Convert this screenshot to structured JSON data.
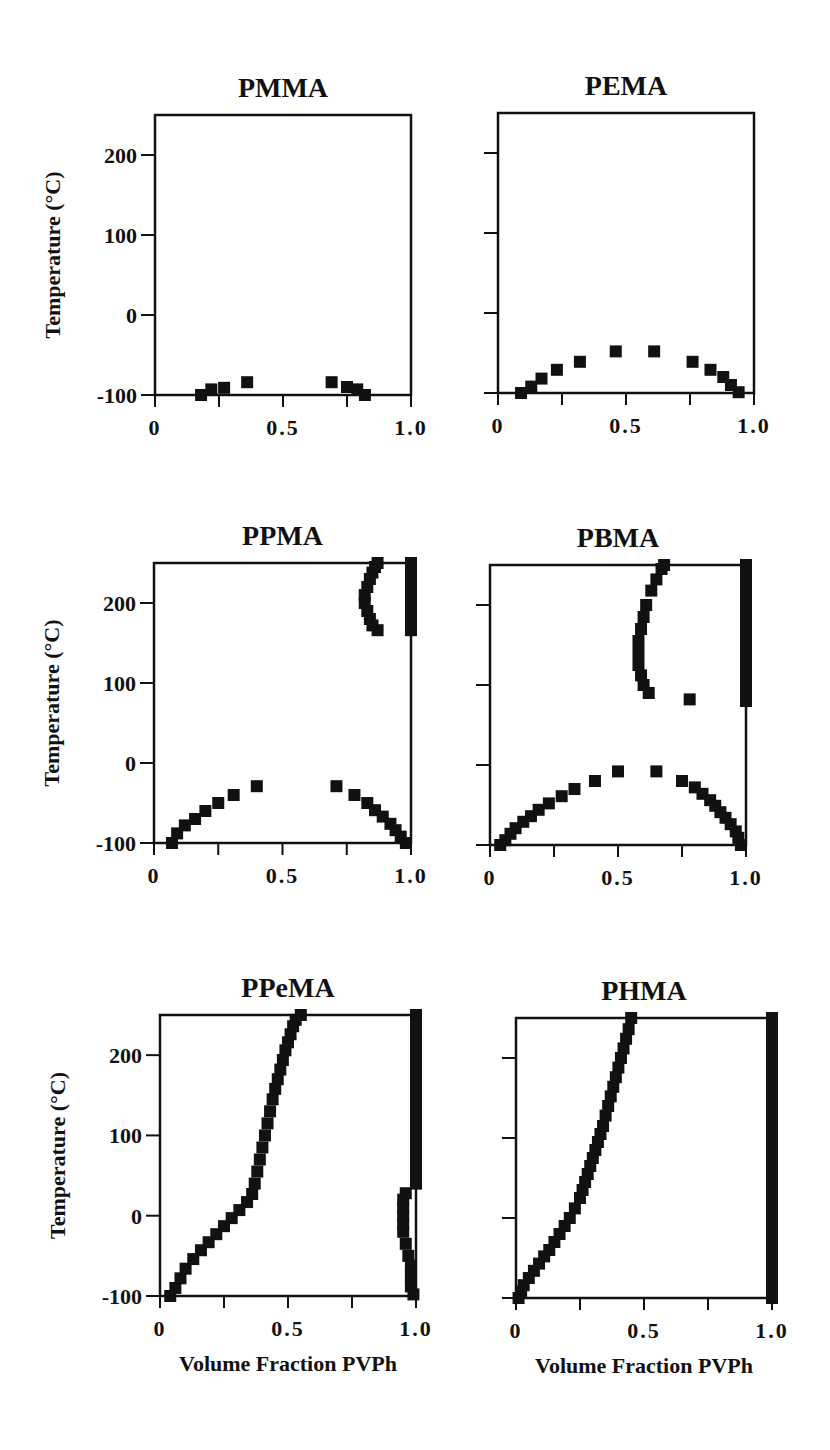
{
  "figure": {
    "background": "#ffffff",
    "ink_color": "#111111",
    "ylabel": "Temperature  (°C)",
    "xlabel": "Volume   Fraction   PVPh"
  },
  "chart_data": [
    {
      "type": "scatter",
      "title": "PMMA",
      "xlabel": "",
      "ylabel": "Temperature  (°C)",
      "xlim": [
        0,
        1.0
      ],
      "ylim": [
        -100,
        250
      ],
      "xticks": [
        "0",
        "0.5",
        "1.0"
      ],
      "yticks": [
        "-100",
        "0",
        "100",
        "200"
      ],
      "show_ytick_labels": true,
      "frame": {
        "x": 155,
        "y": 115,
        "w": 256,
        "h": 280
      },
      "series": [
        {
          "name": "binodal",
          "x": [
            0.18,
            0.22,
            0.27,
            0.36,
            0.69,
            0.75,
            0.79,
            0.82
          ],
          "y": [
            -100,
            -93,
            -91,
            -84,
            -84,
            -90,
            -93,
            -100
          ]
        }
      ]
    },
    {
      "type": "scatter",
      "title": "PEMA",
      "xlabel": "",
      "ylabel": "",
      "xlim": [
        0,
        1.0
      ],
      "ylim": [
        -100,
        250
      ],
      "xticks": [
        "0",
        "0.5",
        "1.0"
      ],
      "yticks": [
        "-100",
        "0",
        "100",
        "200"
      ],
      "show_ytick_labels": false,
      "frame": {
        "x": 498,
        "y": 113,
        "w": 256,
        "h": 280
      },
      "series": [
        {
          "name": "binodal",
          "x": [
            0.09,
            0.13,
            0.17,
            0.23,
            0.32,
            0.46,
            0.61,
            0.76,
            0.83,
            0.88,
            0.91,
            0.94
          ],
          "y": [
            -100,
            -92,
            -82,
            -71,
            -61,
            -48,
            -48,
            -61,
            -71,
            -80,
            -90,
            -99
          ]
        }
      ]
    },
    {
      "type": "scatter",
      "title": "PPMA",
      "xlabel": "",
      "ylabel": "Temperature  (°C)",
      "xlim": [
        0,
        1.0
      ],
      "ylim": [
        -100,
        250
      ],
      "xticks": [
        "0",
        "0.5",
        "1.0"
      ],
      "yticks": [
        "-100",
        "0",
        "100",
        "200"
      ],
      "show_ytick_labels": true,
      "frame": {
        "x": 154,
        "y": 563,
        "w": 257,
        "h": 280
      },
      "series": [
        {
          "name": "lower binodal",
          "x": [
            0.07,
            0.09,
            0.12,
            0.16,
            0.2,
            0.25,
            0.31,
            0.4,
            0.71,
            0.78,
            0.83,
            0.86,
            0.89,
            0.92,
            0.94,
            0.96,
            0.98
          ],
          "y": [
            -100,
            -88,
            -78,
            -70,
            -60,
            -50,
            -40,
            -29,
            -29,
            -40,
            -50,
            -59,
            -67,
            -76,
            -84,
            -92,
            -100
          ]
        },
        {
          "name": "upper binodal left",
          "x": [
            0.87,
            0.86,
            0.85,
            0.84,
            0.83,
            0.82,
            0.82,
            0.83,
            0.84,
            0.85,
            0.87
          ],
          "y": [
            250,
            245,
            238,
            230,
            220,
            210,
            200,
            190,
            180,
            172,
            166
          ]
        },
        {
          "name": "upper binodal right",
          "x": [
            1.0,
            1.0,
            1.0,
            1.0,
            1.0,
            1.0,
            1.0,
            1.0,
            1.0
          ],
          "y": [
            250,
            240,
            230,
            220,
            210,
            200,
            190,
            180,
            166
          ]
        }
      ]
    },
    {
      "type": "scatter",
      "title": "PBMA",
      "xlabel": "",
      "ylabel": "",
      "xlim": [
        0,
        1.0
      ],
      "ylim": [
        -100,
        250
      ],
      "xticks": [
        "0",
        "0.5",
        "1.0"
      ],
      "yticks": [
        "-100",
        "0",
        "100",
        "200"
      ],
      "show_ytick_labels": false,
      "frame": {
        "x": 490,
        "y": 565,
        "w": 256,
        "h": 280
      },
      "series": [
        {
          "name": "lower binodal",
          "x": [
            0.04,
            0.06,
            0.08,
            0.1,
            0.13,
            0.16,
            0.19,
            0.23,
            0.28,
            0.33,
            0.41,
            0.5,
            0.65,
            0.75,
            0.8,
            0.83,
            0.86,
            0.88,
            0.9,
            0.92,
            0.94,
            0.96,
            0.97,
            0.98
          ],
          "y": [
            -100,
            -94,
            -86,
            -79,
            -71,
            -64,
            -56,
            -48,
            -39,
            -30,
            -20,
            -8,
            -8,
            -20,
            -28,
            -36,
            -44,
            -51,
            -59,
            -66,
            -74,
            -83,
            -91,
            -100
          ]
        },
        {
          "name": "upper binodal left",
          "x": [
            0.68,
            0.67,
            0.65,
            0.63,
            0.61,
            0.6,
            0.59,
            0.58,
            0.58,
            0.58,
            0.59,
            0.6,
            0.62
          ],
          "y": [
            250,
            245,
            232,
            218,
            200,
            185,
            170,
            155,
            140,
            125,
            112,
            100,
            90
          ]
        },
        {
          "name": "isolated point",
          "x": [
            0.78
          ],
          "y": [
            82
          ]
        },
        {
          "name": "upper binodal right",
          "x": [
            1.0,
            1.0,
            1.0,
            1.0,
            1.0,
            1.0,
            1.0,
            1.0,
            1.0,
            1.0,
            1.0,
            1.0,
            1.0,
            1.0,
            1.0,
            1.0,
            1.0,
            1.0
          ],
          "y": [
            250,
            240,
            230,
            220,
            210,
            200,
            190,
            180,
            170,
            160,
            150,
            140,
            130,
            120,
            110,
            100,
            90,
            80
          ]
        }
      ]
    },
    {
      "type": "scatter",
      "title": "PPeMA",
      "xlabel": "Volume   Fraction   PVPh",
      "ylabel": "Temperature  (°C)",
      "xlim": [
        0,
        1.0
      ],
      "ylim": [
        -100,
        250
      ],
      "xticks": [
        "0",
        "0.5",
        "1.0"
      ],
      "yticks": [
        "-100",
        "0",
        "100",
        "200"
      ],
      "show_ytick_labels": true,
      "frame": {
        "x": 160,
        "y": 1015,
        "w": 256,
        "h": 281
      },
      "series": [
        {
          "name": "left binodal",
          "x": [
            0.04,
            0.06,
            0.08,
            0.1,
            0.13,
            0.16,
            0.19,
            0.22,
            0.25,
            0.28,
            0.31,
            0.34,
            0.36,
            0.37,
            0.38,
            0.39,
            0.4,
            0.41,
            0.42,
            0.43,
            0.44,
            0.45,
            0.46,
            0.47,
            0.48,
            0.49,
            0.5,
            0.51,
            0.52,
            0.53,
            0.55
          ],
          "y": [
            -100,
            -90,
            -78,
            -66,
            -54,
            -43,
            -33,
            -23,
            -13,
            -3,
            7,
            17,
            27,
            40,
            55,
            70,
            85,
            100,
            115,
            130,
            145,
            158,
            170,
            182,
            194,
            206,
            216,
            226,
            236,
            244,
            250
          ]
        },
        {
          "name": "right binodal upper",
          "x": [
            1.0,
            1.0,
            1.0,
            1.0,
            1.0,
            1.0,
            1.0,
            1.0,
            1.0,
            1.0,
            1.0,
            1.0,
            1.0,
            1.0,
            1.0,
            1.0,
            1.0,
            1.0,
            1.0,
            1.0,
            1.0,
            1.0
          ],
          "y": [
            250,
            240,
            230,
            220,
            210,
            200,
            190,
            180,
            170,
            160,
            150,
            140,
            130,
            120,
            110,
            100,
            90,
            80,
            70,
            60,
            50,
            40
          ]
        },
        {
          "name": "right binodal lower",
          "x": [
            0.96,
            0.95,
            0.95,
            0.95,
            0.95,
            0.95,
            0.96,
            0.97,
            0.98,
            0.98,
            0.98,
            0.99
          ],
          "y": [
            28,
            20,
            10,
            0,
            -10,
            -20,
            -35,
            -50,
            -62,
            -75,
            -88,
            -98
          ]
        }
      ]
    },
    {
      "type": "scatter",
      "title": "PHMA",
      "xlabel": "Volume   Fraction   PVPh",
      "ylabel": "",
      "xlim": [
        0,
        1.0
      ],
      "ylim": [
        -100,
        250
      ],
      "xticks": [
        "0",
        "0.5",
        "1.0"
      ],
      "yticks": [
        "-100",
        "0",
        "100",
        "200"
      ],
      "show_ytick_labels": false,
      "frame": {
        "x": 516,
        "y": 1018,
        "w": 256,
        "h": 280
      },
      "series": [
        {
          "name": "left binodal",
          "x": [
            0.01,
            0.02,
            0.03,
            0.05,
            0.07,
            0.09,
            0.11,
            0.13,
            0.15,
            0.17,
            0.19,
            0.21,
            0.23,
            0.25,
            0.26,
            0.27,
            0.28,
            0.29,
            0.3,
            0.31,
            0.32,
            0.33,
            0.34,
            0.35,
            0.36,
            0.37,
            0.38,
            0.39,
            0.4,
            0.41,
            0.42,
            0.43,
            0.44,
            0.45
          ],
          "y": [
            -100,
            -92,
            -84,
            -75,
            -66,
            -57,
            -48,
            -40,
            -30,
            -20,
            -10,
            0,
            12,
            25,
            35,
            45,
            55,
            65,
            75,
            85,
            95,
            105,
            115,
            128,
            140,
            152,
            164,
            176,
            188,
            200,
            212,
            224,
            236,
            250
          ]
        },
        {
          "name": "right binodal",
          "x": [
            1.0,
            1.0,
            1.0,
            1.0,
            1.0,
            1.0,
            1.0,
            1.0,
            1.0,
            1.0,
            1.0,
            1.0,
            1.0,
            1.0,
            1.0,
            1.0,
            1.0,
            1.0,
            1.0,
            1.0,
            1.0,
            1.0,
            1.0,
            1.0,
            1.0,
            1.0,
            1.0,
            1.0,
            1.0,
            1.0,
            1.0,
            1.0,
            1.0,
            1.0,
            1.0,
            1.0
          ],
          "y": [
            250,
            240,
            230,
            220,
            210,
            200,
            190,
            180,
            170,
            160,
            150,
            140,
            130,
            120,
            110,
            100,
            90,
            80,
            70,
            60,
            50,
            40,
            30,
            20,
            10,
            0,
            -10,
            -20,
            -30,
            -40,
            -50,
            -60,
            -70,
            -80,
            -90,
            -100
          ]
        }
      ]
    }
  ]
}
